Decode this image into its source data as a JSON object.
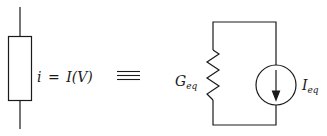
{
  "diagram": {
    "left_element": {
      "label_lhs": "i",
      "label_eq": "=",
      "label_rhs_fn": "I",
      "label_rhs_arg": "(V)",
      "type": "nonlinear-element-box"
    },
    "equivalence_symbol": "≡",
    "right_circuit": {
      "resistor_label_main": "G",
      "resistor_label_sub": "eq",
      "source_label_main": "I",
      "source_label_sub": "eq",
      "source_direction": "down"
    },
    "colors": {
      "stroke": "#1a1a1a",
      "background": "#ffffff"
    }
  }
}
